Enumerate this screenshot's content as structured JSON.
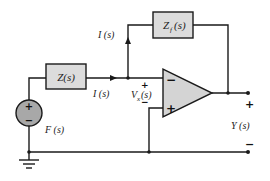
{
  "diagram": {
    "type": "op-amp inverting amplifier circuit",
    "colors": {
      "wire": "#1a1a1a",
      "box_fill": "#dcdcdc",
      "opamp_fill": "#d4d4d4",
      "source_fill": "#a8a8a8"
    },
    "components": {
      "input_impedance": {
        "label": "Z(s)"
      },
      "feedback_impedance": {
        "label_main": "Z",
        "label_sub": "f",
        "label_tail": "(s)"
      },
      "source": {
        "label": "F (s)",
        "plus": "+",
        "minus": "−"
      },
      "opamp": {
        "inverting": "−",
        "noninverting": "+"
      }
    },
    "labels": {
      "feedback_current": "I (s)",
      "input_current": "I (s)",
      "vx_main": "V",
      "vx_sub": "x",
      "vx_tail": "(s)",
      "vx_plus": "+",
      "vx_minus": "−",
      "output": "Y (s)",
      "output_plus": "+",
      "output_minus": "−"
    }
  }
}
